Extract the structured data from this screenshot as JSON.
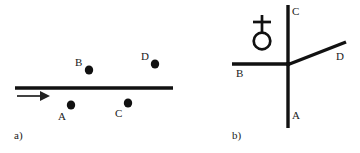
{
  "figure": {
    "width": 360,
    "height": 153,
    "background": "#ffffff",
    "ink": "#111111"
  },
  "panel_a": {
    "caption": "a)",
    "caption_x": 14,
    "caption_y": 131,
    "description": "Horizontal straight line with a leftward-origin arrow pointing right; four labeled dots, two above the line (B, D) and two below the line (A, C).",
    "line": {
      "name": "horizontal-line",
      "x1": 15,
      "y1": 88,
      "x2": 173,
      "y2": 88,
      "stroke_width": 3.4
    },
    "arrow": {
      "name": "direction-arrow",
      "x1": 17,
      "y1": 96,
      "x2": 48,
      "y2": 96,
      "stroke_width": 1.6,
      "head_length": 10,
      "head_half_width": 5
    },
    "points": [
      {
        "id": "B",
        "label": "B",
        "cx": 89,
        "cy": 70,
        "r": 4.3,
        "label_x": 75,
        "label_y": 57,
        "side": "above"
      },
      {
        "id": "D",
        "label": "D",
        "cx": 155,
        "cy": 64,
        "r": 4.3,
        "label_x": 141,
        "label_y": 51,
        "side": "above"
      },
      {
        "id": "A",
        "label": "A",
        "cx": 71,
        "cy": 105,
        "r": 4.3,
        "label_x": 58,
        "label_y": 112,
        "side": "below"
      },
      {
        "id": "C",
        "label": "C",
        "cx": 128,
        "cy": 103,
        "r": 4.3,
        "label_x": 115,
        "label_y": 109,
        "side": "below"
      }
    ]
  },
  "panel_b": {
    "caption": "b)",
    "caption_x": 232,
    "caption_y": 131,
    "description": "Junction point with a vertical line running up (C) and down (A), a horizontal branch to the left (B), and a diagonal branch up-right (D). A Venus-like symbol (circle with a cross above it) sits in the upper-left quadrant.",
    "junction": {
      "x": 288,
      "y": 64
    },
    "branches": [
      {
        "id": "C",
        "label": "C",
        "x1": 288,
        "y1": 64,
        "x2": 288,
        "y2": 5,
        "stroke_width": 3.4,
        "label_x": 292,
        "label_y": 6
      },
      {
        "id": "A",
        "label": "A",
        "x1": 288,
        "y1": 64,
        "x2": 288,
        "y2": 128,
        "stroke_width": 3.4,
        "label_x": 292,
        "label_y": 111
      },
      {
        "id": "B",
        "label": "B",
        "x1": 288,
        "y1": 64,
        "x2": 232,
        "y2": 64,
        "stroke_width": 3.4,
        "label_x": 236,
        "label_y": 69
      },
      {
        "id": "D",
        "label": "D",
        "x1": 288,
        "y1": 64,
        "x2": 346,
        "y2": 42,
        "stroke_width": 3.4,
        "label_x": 336,
        "label_y": 52
      }
    ],
    "symbol": {
      "name": "venus-inverted-symbol",
      "glyph_description": "circle with vertical stem and horizontal crossbar above",
      "circle_cx": 262,
      "circle_cy": 41,
      "circle_r": 8.5,
      "circle_stroke_width": 2.6,
      "stem_x": 262,
      "stem_y_top": 15,
      "stem_y_bottom": 33,
      "stem_stroke_width": 2.6,
      "crossbar_y": 22,
      "crossbar_x1": 253,
      "crossbar_x2": 271,
      "crossbar_stroke_width": 2.6
    }
  }
}
